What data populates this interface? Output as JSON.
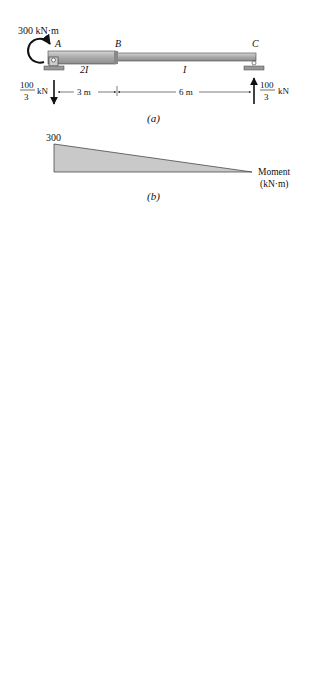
{
  "figure_a": {
    "caption": "(a)",
    "applied_moment": "300 kN·m",
    "node_A": "A",
    "node_B": "B",
    "node_C": "C",
    "segment_AB_inertia": "2I",
    "segment_BC_inertia": "I",
    "reaction_A": {
      "num": "100",
      "den": "3",
      "unit": "kN",
      "direction": "down"
    },
    "reaction_C": {
      "num": "100",
      "den": "3",
      "unit": "kN",
      "direction": "up"
    },
    "dim_AB": "3 m",
    "dim_BC": "6 m"
  },
  "figure_b": {
    "caption": "(b)",
    "peak_value": "300",
    "label_line1": "Moment",
    "label_line2": "(kN·m)"
  },
  "figure_c": {
    "caption": "(c)",
    "R1": {
      "label": "R",
      "sub": "1",
      "num": "75",
      "den": "EI"
    },
    "R2": {
      "label": "R",
      "sub": "2",
      "num": "300",
      "den": "EI"
    },
    "R3": {
      "label": "R",
      "sub": "3",
      "num": "600",
      "den": "EI"
    },
    "ord_150": {
      "num": "150",
      "den": "EI"
    },
    "ord_100": {
      "num": "100",
      "den": "EI"
    },
    "ord_200": {
      "num": "200",
      "den": "EI"
    },
    "elastic_line1": "Elastic",
    "elastic_line2": "loads",
    "reaction_A": {
      "num": "583.33",
      "den": "EI"
    },
    "reaction_C": {
      "num": "391.67",
      "den": "EI"
    },
    "dim_05": "0.5 m",
    "dim_1": "1 m",
    "dim_35": "3.5 m",
    "dim_4": "4 m"
  },
  "figure_d": {
    "caption": "(d)",
    "right_value": {
      "num": "391.67",
      "den": "EI"
    },
    "left_value": {
      "sign": "−",
      "num": "583.33",
      "den": "EI"
    },
    "label": "Shear (slope)",
    "dim_zero": "4.85 m"
  },
  "figure_e": {
    "caption": "(e)",
    "resultant": {
      "num": "600",
      "den": "EI"
    },
    "moment_label": "M",
    "moment_sub": "B",
    "span": "6 m",
    "centroid": "x̄ = 2 m",
    "reaction": {
      "num": "391.67",
      "den": "EI"
    }
  }
}
